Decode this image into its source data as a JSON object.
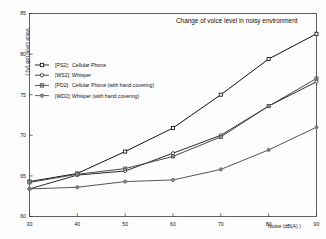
{
  "chart_data": {
    "type": "line",
    "title": "Change of voice level in noisy environment",
    "xlabel": "Noise (dB(A) )",
    "ylabel": "Voice Level (dB (A) )",
    "x": [
      30,
      40,
      50,
      60,
      70,
      80,
      90
    ],
    "xticks": [
      "30",
      "40",
      "50",
      "60",
      "70",
      "80",
      "90"
    ],
    "yticks": [
      "60",
      "65",
      "70",
      "75",
      "80",
      "85"
    ],
    "xlim": [
      30,
      90
    ],
    "ylim": [
      60,
      85
    ],
    "grid": false,
    "legend_position": "upper-left-inside",
    "series": [
      {
        "name": "[PS2]:  Cellular Phone",
        "code": "PS2",
        "label": "Cellular Phone",
        "marker": "square",
        "color": "#111111",
        "values": [
          64.3,
          65.3,
          68.0,
          70.9,
          75.0,
          79.4,
          82.5
        ]
      },
      {
        "name": "[WS2]:  Whisper",
        "code": "WS2",
        "label": "Whisper",
        "marker": "circle",
        "color": "#2a2a2a",
        "values": [
          63.4,
          65.1,
          65.6,
          67.8,
          70.0,
          73.6,
          76.6
        ]
      },
      {
        "name": "[PD2]:  Cellular Phone (with hand covering)",
        "code": "PD2",
        "label": "Cellular Phone (with hand covering)",
        "marker": "square-cross",
        "color": "#4a4a4a",
        "values": [
          64.2,
          65.2,
          65.9,
          67.4,
          69.8,
          73.6,
          77.0
        ]
      },
      {
        "name": "[WD2]:  Whisper (with hand covering)",
        "code": "WD2",
        "label": "Whisper (with hand covering)",
        "marker": "circle-cross",
        "color": "#555555",
        "values": [
          63.4,
          63.6,
          64.3,
          64.5,
          65.8,
          68.2,
          71.0
        ]
      }
    ]
  },
  "legend": {
    "entries": [
      {
        "tag": "[PS2]:",
        "text": "Cellular Phone"
      },
      {
        "tag": "[WS2]:",
        "text": "Whisper"
      },
      {
        "tag": "[PD2]:",
        "text": "Cellular Phone (with hand covering)"
      },
      {
        "tag": "[WD2]:",
        "text": "Whisper (with hand covering)"
      }
    ]
  }
}
